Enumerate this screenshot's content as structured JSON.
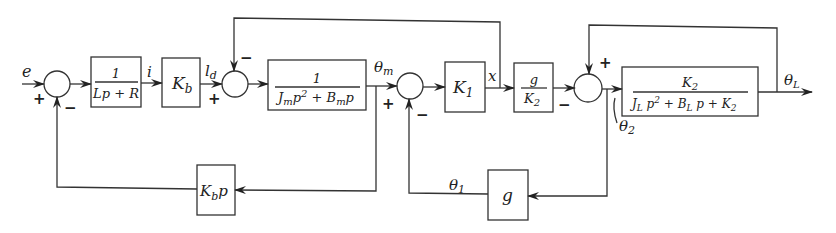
{
  "diagram": {
    "type": "block-diagram",
    "signals": {
      "input": "e",
      "current": "i",
      "torque": "l",
      "torque_sub": "d",
      "theta_m": "θ",
      "theta_m_sub": "m",
      "x": "x",
      "theta_1": "θ",
      "theta_1_sub": "1",
      "theta_2": "θ",
      "theta_2_sub": "2",
      "theta_L": "θ",
      "theta_L_sub": "L"
    },
    "blocks": {
      "electrical": {
        "num": "1",
        "den": "Lp + R"
      },
      "kb": {
        "main": "K",
        "sub": "b"
      },
      "motor": {
        "num": "1",
        "den_a": "J",
        "den_a_sub": "m",
        "den_b": "p",
        "den_b_sup": "2",
        "den_c": " + B",
        "den_c_sub": "m",
        "den_d": "p"
      },
      "k1": {
        "main": "K",
        "sub": "1"
      },
      "g_over_k2": {
        "num": "g",
        "den": "K",
        "den_sub": "2"
      },
      "load": {
        "num": "K",
        "num_sub": "2",
        "den_a": "J",
        "den_a_sub": "L",
        "den_b": " p",
        "den_b_sup": "2",
        "den_c": " + B",
        "den_c_sub": "L",
        "den_d": " p + K",
        "den_d_sub": "2"
      },
      "back_emf": {
        "main": "K",
        "sub": "b",
        "tail": "p"
      },
      "gear": {
        "main": "g"
      }
    },
    "signs": {
      "sum1_plus": "+",
      "sum1_minus": "−",
      "sum2_plus": "+",
      "sum2_minus": "−",
      "sum3_plus": "+",
      "sum3_minus": "−",
      "sum4_plus": "+",
      "sum4_minus": "−"
    }
  }
}
